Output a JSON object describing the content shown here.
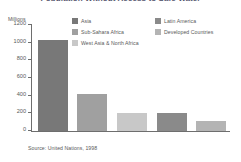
{
  "chart_data": {
    "type": "bar",
    "title": "Population Without Access to Safe Water",
    "subtitle": "",
    "xlabel": "",
    "ylabel": "Millions",
    "ylim": [
      0,
      1200
    ],
    "yticks": [
      1200,
      1000,
      800,
      600,
      400,
      200,
      0
    ],
    "ytick_labels": [
      "1200",
      "1000",
      "800",
      "600",
      "400",
      "200",
      "0"
    ],
    "grid": false,
    "legend_position": "top",
    "categories": [
      "Asia",
      "Sub-Sahara Africa",
      "West Asia & North Africa",
      "Latin America",
      "Developed Countries"
    ],
    "values": [
      1010,
      400,
      180,
      185,
      90
    ],
    "colors": [
      "#787878",
      "#a0a0a0",
      "#c8c8c8",
      "#8a8a8a",
      "#b4b4b4"
    ],
    "source": "Source: United Nations, 1998"
  },
  "legend": {
    "columns": [
      {
        "items": [
          {
            "label": "Asia",
            "color": "#787878"
          },
          {
            "label": "Sub-Sahara Africa",
            "color": "#a0a0a0"
          },
          {
            "label": "West Asia & North Africa",
            "color": "#c8c8c8"
          }
        ]
      },
      {
        "items": [
          {
            "label": "Latin America",
            "color": "#8a8a8a"
          },
          {
            "label": "Developed Countries",
            "color": "#b4b4b4"
          }
        ]
      }
    ]
  }
}
